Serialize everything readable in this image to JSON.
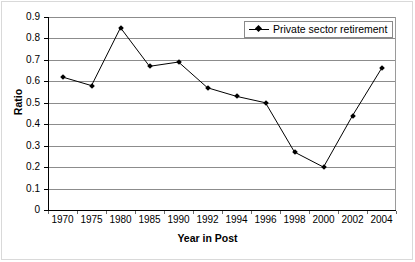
{
  "chart_data": {
    "type": "line",
    "title": "",
    "xlabel": "Year in Post",
    "ylabel": "Ratio",
    "categories": [
      "1970",
      "1975",
      "1980",
      "1985",
      "1990",
      "1992",
      "1994",
      "1996",
      "1998",
      "2000",
      "2002",
      "2004"
    ],
    "series": [
      {
        "name": "Private sector retirement",
        "values": [
          0.62,
          0.58,
          0.85,
          0.67,
          0.69,
          0.57,
          0.53,
          0.5,
          0.27,
          0.2,
          0.44,
          0.66
        ],
        "color": "#000000",
        "marker": "diamond"
      }
    ],
    "ylim": [
      0,
      0.9
    ],
    "ytick_labels": [
      "0.9",
      "0.8",
      "0.7",
      "0.6",
      "0.5",
      "0.4",
      "0.3",
      "0.2",
      "0.1",
      "0"
    ],
    "ytick_values": [
      0.9,
      0.8,
      0.7,
      0.6,
      0.5,
      0.4,
      0.3,
      0.2,
      0.1,
      0
    ],
    "grid": "horizontal",
    "grid_color": "#8c8c8c",
    "legend_position": "top-right-inside",
    "background": "#ffffff",
    "axis_color": "#000000"
  },
  "legend": {
    "entries": [
      {
        "label": "Private sector retirement",
        "marker_name": "diamond-marker"
      }
    ]
  },
  "axes": {
    "y_title": "Ratio",
    "x_title": "Year in Post"
  }
}
